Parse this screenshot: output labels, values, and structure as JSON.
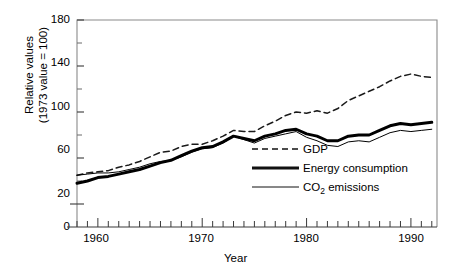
{
  "chart_data": {
    "type": "line",
    "title": "",
    "xlabel": "Year",
    "ylabel": "Relative values\n(1973 value = 100)",
    "ylabel_line1": "Relative values",
    "ylabel_line2": "(1973 value = 100)",
    "xlim": [
      1958,
      1992.5
    ],
    "ylim": [
      0,
      180
    ],
    "yticks": [
      20,
      60,
      100,
      140,
      180
    ],
    "ytick_labels": [
      "20",
      "60",
      "100",
      "140",
      "180"
    ],
    "y_axis_origin_label": "0",
    "xticks": [
      1960,
      1970,
      1980,
      1990
    ],
    "xtick_labels": [
      "1960",
      "1970",
      "1980",
      "1990"
    ],
    "x_minor_tick_interval": 1,
    "grid": false,
    "legend_position": "center-right-inside",
    "series": [
      {
        "name": "GDP",
        "style": "dashed",
        "width": 1.5,
        "color": "#1a1a1a",
        "x": [
          1958,
          1959,
          1960,
          1961,
          1962,
          1963,
          1964,
          1965,
          1966,
          1967,
          1968,
          1969,
          1970,
          1971,
          1972,
          1973,
          1974,
          1975,
          1976,
          1977,
          1978,
          1979,
          1980,
          1981,
          1982,
          1983,
          1984,
          1985,
          1986,
          1987,
          1988,
          1989,
          1990,
          1991,
          1992
        ],
        "values": [
          45,
          47,
          48,
          49,
          52,
          54,
          57,
          61,
          65,
          66,
          70,
          72,
          72,
          75,
          79,
          84,
          83,
          83,
          88,
          92,
          97,
          100,
          99,
          101,
          99,
          103,
          110,
          114,
          118,
          122,
          127,
          131,
          133,
          131,
          130
        ]
      },
      {
        "name": "Energy consumption",
        "style": "solid",
        "width": 3.0,
        "color": "#000000",
        "x": [
          1958,
          1959,
          1960,
          1961,
          1962,
          1963,
          1964,
          1965,
          1966,
          1967,
          1968,
          1969,
          1970,
          1971,
          1972,
          1973,
          1974,
          1975,
          1976,
          1977,
          1978,
          1979,
          1980,
          1981,
          1982,
          1983,
          1984,
          1985,
          1986,
          1987,
          1988,
          1989,
          1990,
          1991,
          1992
        ],
        "values": [
          38,
          40,
          43,
          44,
          46,
          48,
          50,
          53,
          56,
          58,
          62,
          66,
          69,
          70,
          74,
          79,
          77,
          75,
          79,
          81,
          84,
          85,
          81,
          79,
          75,
          75,
          79,
          80,
          80,
          84,
          88,
          90,
          89,
          90,
          91
        ]
      },
      {
        "name": "CO2 emissions",
        "style": "solid",
        "width": 1.0,
        "color": "#000000",
        "x": [
          1958,
          1959,
          1960,
          1961,
          1962,
          1963,
          1964,
          1965,
          1966,
          1967,
          1968,
          1969,
          1970,
          1971,
          1972,
          1973,
          1974,
          1975,
          1976,
          1977,
          1978,
          1979,
          1980,
          1981,
          1982,
          1983,
          1984,
          1985,
          1986,
          1987,
          1988,
          1989,
          1990,
          1991,
          1992
        ],
        "values": [
          45,
          46,
          47,
          47,
          48,
          50,
          52,
          55,
          57,
          58,
          61,
          65,
          68,
          69,
          73,
          79,
          76,
          73,
          77,
          79,
          81,
          83,
          78,
          75,
          71,
          70,
          74,
          75,
          74,
          78,
          82,
          84,
          83,
          84,
          85
        ]
      }
    ],
    "legend_entries": [
      {
        "label": "GDP",
        "style": "dashed"
      },
      {
        "label": "Energy consumption",
        "style": "thick-solid"
      },
      {
        "label": "CO2 emissions",
        "style": "thin-solid",
        "label_prefix": "CO",
        "label_sub": "2",
        "label_suffix": " emissions"
      }
    ]
  }
}
